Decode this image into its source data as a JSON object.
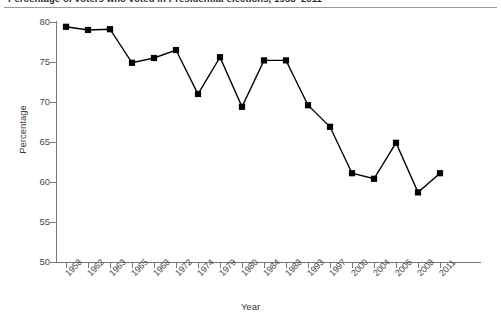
{
  "title": {
    "text": "Percentage of voters who voted in Presidential elections, 1958–2011",
    "cropped": true
  },
  "chart_data": {
    "type": "line",
    "title": "Percentage of voters who voted in Presidential elections, 1958–2011",
    "xlabel": "Year",
    "ylabel": "Percentage",
    "ylim": [
      50,
      80
    ],
    "yticks": [
      50,
      55,
      60,
      65,
      70,
      75,
      80
    ],
    "grid": false,
    "legend": "none",
    "marker": "square",
    "marker_color": "#000000",
    "line_color": "#000000",
    "categories": [
      "1958",
      "1962",
      "1963",
      "1965",
      "1968",
      "1972",
      "1974",
      "1979",
      "1980",
      "1984",
      "1988",
      "1993",
      "1997",
      "2000",
      "2004",
      "2006",
      "2008",
      "2011"
    ],
    "x": [
      1958,
      1962,
      1963,
      1965,
      1968,
      1972,
      1974,
      1979,
      1980,
      1984,
      1988,
      1993,
      1997,
      2000,
      2004,
      2006,
      2008,
      2011
    ],
    "values": [
      79.4,
      79.0,
      79.1,
      74.9,
      75.5,
      76.5,
      71.0,
      75.6,
      69.4,
      75.2,
      75.2,
      69.6,
      66.9,
      61.1,
      60.4,
      64.9,
      58.7,
      61.1
    ]
  },
  "axis": {
    "y_title": "Percentage",
    "x_title": "Year"
  },
  "colors": {
    "series": "#000000",
    "axis": "#787878",
    "text": "#3b3b3b",
    "background": "#ffffff"
  }
}
